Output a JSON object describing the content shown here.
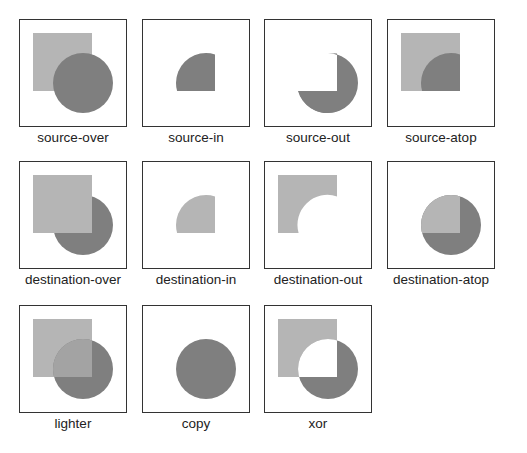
{
  "colors": {
    "destination": "#b5b5b5",
    "source": "#7f7f7f",
    "border": "#333333"
  },
  "modes": [
    {
      "label": "source-over"
    },
    {
      "label": "source-in"
    },
    {
      "label": "source-out"
    },
    {
      "label": "source-atop"
    },
    {
      "label": "destination-over"
    },
    {
      "label": "destination-in"
    },
    {
      "label": "destination-out"
    },
    {
      "label": "destination-atop"
    },
    {
      "label": "lighter"
    },
    {
      "label": "copy"
    },
    {
      "label": "xor"
    }
  ]
}
